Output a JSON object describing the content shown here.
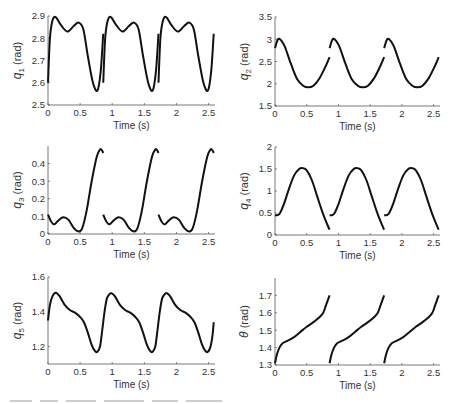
{
  "figure": {
    "caption_partial": "Figure 7.X ..."
  },
  "chart_data": [
    {
      "type": "line",
      "id": "q1",
      "title": "",
      "xlabel": "Time (s)",
      "ylabel": "q1 (rad)",
      "ylabel_main": "q",
      "ylabel_sub": "1",
      "ylabel_unit": "(rad)",
      "xlim": [
        0,
        2.6
      ],
      "ylim": [
        2.5,
        2.9
      ],
      "xticks": [
        0,
        0.5,
        1,
        1.5,
        2,
        2.5
      ],
      "xtick_labels": [
        "0",
        "0.5",
        "1",
        "1.5",
        "2",
        "2.5"
      ],
      "yticks": [
        2.5,
        2.6,
        2.7,
        2.8,
        2.9
      ],
      "ytick_labels": [
        "2.5",
        "2.6",
        "2.7",
        "2.8",
        "2.9"
      ],
      "grid": false,
      "segments": [
        {
          "x": [
            0,
            0.03,
            0.07,
            0.12,
            0.2,
            0.3,
            0.4,
            0.48,
            0.55,
            0.62,
            0.7,
            0.77,
            0.82,
            0.86
          ],
          "y": [
            2.6,
            2.8,
            2.88,
            2.895,
            2.86,
            2.83,
            2.855,
            2.87,
            2.84,
            2.72,
            2.6,
            2.565,
            2.65,
            2.82
          ]
        },
        {
          "x": [
            0.86,
            0.89,
            0.93,
            0.98,
            1.06,
            1.16,
            1.26,
            1.34,
            1.41,
            1.48,
            1.56,
            1.63,
            1.68,
            1.72
          ],
          "y": [
            2.6,
            2.8,
            2.88,
            2.895,
            2.86,
            2.83,
            2.855,
            2.87,
            2.84,
            2.72,
            2.6,
            2.565,
            2.65,
            2.82
          ]
        },
        {
          "x": [
            1.72,
            1.75,
            1.79,
            1.84,
            1.92,
            2.02,
            2.12,
            2.2,
            2.27,
            2.34,
            2.42,
            2.49,
            2.54,
            2.58
          ],
          "y": [
            2.6,
            2.8,
            2.88,
            2.895,
            2.86,
            2.83,
            2.855,
            2.87,
            2.84,
            2.72,
            2.6,
            2.565,
            2.65,
            2.82
          ]
        }
      ]
    },
    {
      "type": "line",
      "id": "q2",
      "xlabel": "Time (s)",
      "ylabel": "q2 (rad)",
      "ylabel_main": "q",
      "ylabel_sub": "2",
      "ylabel_unit": "(rad)",
      "xlim": [
        0,
        2.6
      ],
      "ylim": [
        1.5,
        3.5
      ],
      "xticks": [
        0,
        0.5,
        1,
        1.5,
        2,
        2.5
      ],
      "xtick_labels": [
        "0",
        "0.5",
        "1",
        "1.5",
        "2",
        "2.5"
      ],
      "yticks": [
        1.5,
        2,
        2.5,
        3,
        3.5
      ],
      "ytick_labels": [
        "1.5",
        "2",
        "2.5",
        "3",
        "3.5"
      ],
      "grid": false,
      "segments": [
        {
          "x": [
            0,
            0.04,
            0.08,
            0.15,
            0.25,
            0.35,
            0.45,
            0.52,
            0.6,
            0.7,
            0.8,
            0.86
          ],
          "y": [
            2.8,
            2.98,
            3.0,
            2.85,
            2.45,
            2.1,
            1.95,
            1.92,
            1.95,
            2.12,
            2.4,
            2.6
          ]
        },
        {
          "x": [
            0.86,
            0.9,
            0.94,
            1.01,
            1.11,
            1.21,
            1.31,
            1.38,
            1.46,
            1.56,
            1.66,
            1.72
          ],
          "y": [
            2.8,
            2.98,
            3.0,
            2.85,
            2.45,
            2.1,
            1.95,
            1.92,
            1.95,
            2.12,
            2.4,
            2.6
          ]
        },
        {
          "x": [
            1.72,
            1.76,
            1.8,
            1.87,
            1.97,
            2.07,
            2.17,
            2.24,
            2.32,
            2.42,
            2.52,
            2.58
          ],
          "y": [
            2.8,
            2.98,
            3.0,
            2.85,
            2.45,
            2.1,
            1.95,
            1.92,
            1.95,
            2.12,
            2.4,
            2.6
          ]
        }
      ]
    },
    {
      "type": "line",
      "id": "q3",
      "xlabel": "Time (s)",
      "ylabel": "q3 (rad)",
      "ylabel_main": "q",
      "ylabel_sub": "3",
      "ylabel_unit": "(rad)",
      "xlim": [
        0,
        2.6
      ],
      "ylim": [
        0,
        0.5
      ],
      "xticks": [
        0,
        0.5,
        1,
        1.5,
        2,
        2.5
      ],
      "xtick_labels": [
        "0",
        "0.5",
        "1",
        "1.5",
        "2",
        "2.5"
      ],
      "yticks": [
        0,
        0.1,
        0.2,
        0.3,
        0.4
      ],
      "ytick_labels": [
        "0",
        "0.1",
        "0.2",
        "0.3",
        "0.4"
      ],
      "grid": false,
      "segments": [
        {
          "x": [
            0,
            0.05,
            0.1,
            0.17,
            0.24,
            0.32,
            0.4,
            0.47,
            0.53,
            0.6,
            0.68,
            0.76,
            0.81,
            0.84,
            0.86
          ],
          "y": [
            0.11,
            0.07,
            0.055,
            0.08,
            0.095,
            0.08,
            0.035,
            0.015,
            0.03,
            0.13,
            0.3,
            0.44,
            0.48,
            0.475,
            0.46
          ]
        },
        {
          "x": [
            0.86,
            0.91,
            0.96,
            1.03,
            1.1,
            1.18,
            1.26,
            1.33,
            1.39,
            1.46,
            1.54,
            1.62,
            1.67,
            1.7,
            1.72
          ],
          "y": [
            0.11,
            0.07,
            0.055,
            0.08,
            0.095,
            0.08,
            0.035,
            0.015,
            0.03,
            0.13,
            0.3,
            0.44,
            0.48,
            0.475,
            0.46
          ]
        },
        {
          "x": [
            1.72,
            1.77,
            1.82,
            1.89,
            1.96,
            2.04,
            2.12,
            2.19,
            2.25,
            2.32,
            2.4,
            2.48,
            2.53,
            2.56,
            2.58
          ],
          "y": [
            0.11,
            0.07,
            0.055,
            0.08,
            0.095,
            0.08,
            0.035,
            0.015,
            0.03,
            0.13,
            0.3,
            0.44,
            0.48,
            0.475,
            0.46
          ]
        }
      ]
    },
    {
      "type": "line",
      "id": "q4",
      "xlabel": "Time (s)",
      "ylabel": "q4 (rad)",
      "ylabel_main": "q",
      "ylabel_sub": "4",
      "ylabel_unit": "(rad)",
      "xlim": [
        0,
        2.6
      ],
      "ylim": [
        0,
        2
      ],
      "xticks": [
        0,
        0.5,
        1,
        1.5,
        2,
        2.5
      ],
      "xtick_labels": [
        "0",
        "0.5",
        "1",
        "1.5",
        "2",
        "2.5"
      ],
      "yticks": [
        0,
        0.5,
        1,
        1.5,
        2
      ],
      "ytick_labels": [
        "0",
        "0.5",
        "1",
        "1.5",
        "2"
      ],
      "grid": false,
      "segments": [
        {
          "x": [
            0,
            0.04,
            0.08,
            0.14,
            0.22,
            0.3,
            0.38,
            0.44,
            0.5,
            0.58,
            0.66,
            0.74,
            0.8,
            0.86
          ],
          "y": [
            0.45,
            0.45,
            0.5,
            0.7,
            1.05,
            1.35,
            1.5,
            1.52,
            1.47,
            1.25,
            0.9,
            0.55,
            0.32,
            0.12
          ]
        },
        {
          "x": [
            0.86,
            0.9,
            0.94,
            1.0,
            1.08,
            1.16,
            1.24,
            1.3,
            1.36,
            1.44,
            1.52,
            1.6,
            1.66,
            1.72
          ],
          "y": [
            0.45,
            0.45,
            0.5,
            0.7,
            1.05,
            1.35,
            1.5,
            1.52,
            1.47,
            1.25,
            0.9,
            0.55,
            0.32,
            0.12
          ]
        },
        {
          "x": [
            1.72,
            1.76,
            1.8,
            1.86,
            1.94,
            2.02,
            2.1,
            2.16,
            2.22,
            2.3,
            2.38,
            2.46,
            2.52,
            2.58
          ],
          "y": [
            0.45,
            0.45,
            0.5,
            0.7,
            1.05,
            1.35,
            1.5,
            1.52,
            1.47,
            1.25,
            0.9,
            0.55,
            0.32,
            0.12
          ]
        }
      ]
    },
    {
      "type": "line",
      "id": "q5",
      "xlabel": "Time (s)",
      "ylabel": "q5 (rad)",
      "ylabel_main": "q",
      "ylabel_sub": "5",
      "ylabel_unit": "(rad)",
      "xlim": [
        0,
        2.6
      ],
      "ylim": [
        1.1,
        1.6
      ],
      "xticks": [
        0,
        0.5,
        1,
        1.5,
        2,
        2.5
      ],
      "xtick_labels": [
        "0",
        "0.5",
        "1",
        "1.5",
        "2",
        "2.5"
      ],
      "yticks": [
        1.2,
        1.4,
        1.6
      ],
      "ytick_labels": [
        "1.2",
        "1.4",
        "1.6"
      ],
      "grid": false,
      "segments": [
        {
          "x": [
            0,
            0.03,
            0.07,
            0.12,
            0.18,
            0.26,
            0.34,
            0.42,
            0.5,
            0.56,
            0.62,
            0.68,
            0.73,
            0.77,
            0.81,
            0.84,
            0.88,
            0.92,
            0.98
          ],
          "y": [
            1.35,
            1.44,
            1.49,
            1.51,
            1.49,
            1.44,
            1.41,
            1.395,
            1.37,
            1.34,
            1.28,
            1.21,
            1.175,
            1.17,
            1.2,
            1.28,
            1.4,
            1.48,
            1.51
          ]
        },
        {
          "x": [
            0.98,
            1.04,
            1.12,
            1.2,
            1.28,
            1.36,
            1.42,
            1.48,
            1.54,
            1.59,
            1.63,
            1.67,
            1.7,
            1.74,
            1.78,
            1.84
          ],
          "y": [
            1.51,
            1.49,
            1.44,
            1.41,
            1.395,
            1.37,
            1.34,
            1.28,
            1.21,
            1.175,
            1.17,
            1.2,
            1.28,
            1.4,
            1.48,
            1.51
          ]
        },
        {
          "x": [
            1.84,
            1.9,
            1.98,
            2.06,
            2.14,
            2.22,
            2.28,
            2.34,
            2.4,
            2.45,
            2.49,
            2.53,
            2.56,
            2.58
          ],
          "y": [
            1.51,
            1.49,
            1.44,
            1.41,
            1.395,
            1.37,
            1.34,
            1.28,
            1.21,
            1.175,
            1.17,
            1.2,
            1.26,
            1.34
          ]
        }
      ]
    },
    {
      "type": "line",
      "id": "theta",
      "xlabel": "Time (s)",
      "ylabel": "θ (rad)",
      "ylabel_main": "θ",
      "ylabel_sub": "",
      "ylabel_unit": "(rad)",
      "xlim": [
        0,
        2.6
      ],
      "ylim": [
        1.3,
        1.8
      ],
      "xticks": [
        0,
        0.5,
        1,
        1.5,
        2,
        2.5
      ],
      "xtick_labels": [
        "0",
        "0.5",
        "1",
        "1.5",
        "2",
        "2.5"
      ],
      "yticks": [
        1.3,
        1.4,
        1.5,
        1.6,
        1.7
      ],
      "ytick_labels": [
        "1.3",
        "1.4",
        "1.5",
        "1.6",
        "1.7"
      ],
      "grid": false,
      "segments": [
        {
          "x": [
            0,
            0.03,
            0.07,
            0.12,
            0.2,
            0.3,
            0.4,
            0.5,
            0.6,
            0.7,
            0.76,
            0.8,
            0.84,
            0.86
          ],
          "y": [
            1.31,
            1.36,
            1.4,
            1.425,
            1.44,
            1.46,
            1.49,
            1.52,
            1.545,
            1.575,
            1.6,
            1.64,
            1.68,
            1.7
          ]
        },
        {
          "x": [
            0.86,
            0.89,
            0.93,
            0.98,
            1.06,
            1.16,
            1.26,
            1.36,
            1.46,
            1.56,
            1.62,
            1.66,
            1.7,
            1.72
          ],
          "y": [
            1.31,
            1.36,
            1.4,
            1.425,
            1.44,
            1.46,
            1.49,
            1.52,
            1.545,
            1.575,
            1.6,
            1.64,
            1.68,
            1.7
          ]
        },
        {
          "x": [
            1.72,
            1.75,
            1.79,
            1.84,
            1.92,
            2.02,
            2.12,
            2.22,
            2.32,
            2.42,
            2.48,
            2.52,
            2.56,
            2.58
          ],
          "y": [
            1.31,
            1.36,
            1.4,
            1.425,
            1.44,
            1.46,
            1.49,
            1.52,
            1.545,
            1.575,
            1.6,
            1.64,
            1.68,
            1.7
          ]
        }
      ]
    }
  ]
}
